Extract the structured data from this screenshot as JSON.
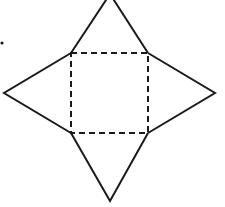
{
  "diagram": {
    "type": "net of a square pyramid",
    "stroke_color": "#1a1a1a",
    "background": "#ffffff",
    "square_base": {
      "style": "dashed",
      "corners": [
        [
          71,
          53
        ],
        [
          148,
          53
        ],
        [
          148,
          133
        ],
        [
          71,
          133
        ]
      ]
    },
    "triangles": [
      {
        "name": "top",
        "apex": [
          110,
          -6
        ]
      },
      {
        "name": "right",
        "apex": [
          215,
          93
        ]
      },
      {
        "name": "bottom",
        "apex": [
          110,
          201
        ]
      },
      {
        "name": "left",
        "apex": [
          4,
          93
        ]
      }
    ],
    "marker_dot": [
      2,
      43
    ]
  }
}
